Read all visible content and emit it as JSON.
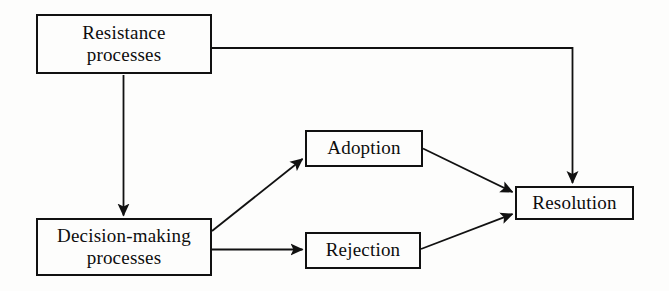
{
  "diagram": {
    "background_color": "#fdfdfc",
    "line_color": "#111111",
    "text_color": "#0d0d0d",
    "width": 669,
    "height": 291,
    "nodes": [
      {
        "id": "resistance",
        "label": "Resistance\nprocesses",
        "x": 36,
        "y": 14,
        "w": 176,
        "h": 60
      },
      {
        "id": "decision",
        "label": "Decision-making\nprocesses",
        "x": 36,
        "y": 218,
        "w": 176,
        "h": 58
      },
      {
        "id": "adoption",
        "label": "Adoption",
        "x": 305,
        "y": 130,
        "w": 118,
        "h": 37
      },
      {
        "id": "rejection",
        "label": "Rejection",
        "x": 305,
        "y": 232,
        "w": 116,
        "h": 37
      },
      {
        "id": "resolution",
        "label": "Resolution",
        "x": 515,
        "y": 186,
        "w": 119,
        "h": 34
      }
    ],
    "edges": [
      {
        "id": "resistance-to-resolution",
        "from": "resistance",
        "to": "resolution",
        "style": "orthogonal",
        "arrowhead": true
      },
      {
        "id": "resistance-to-decision",
        "from": "resistance",
        "to": "decision",
        "style": "vertical",
        "arrowhead": true
      },
      {
        "id": "decision-to-adoption",
        "from": "decision",
        "to": "adoption",
        "style": "diagonal",
        "arrowhead": true
      },
      {
        "id": "decision-to-rejection",
        "from": "decision",
        "to": "rejection",
        "style": "horizontal",
        "arrowhead": true
      },
      {
        "id": "adoption-to-resolution",
        "from": "adoption",
        "to": "resolution",
        "style": "diagonal",
        "arrowhead": true
      },
      {
        "id": "rejection-to-resolution",
        "from": "rejection",
        "to": "resolution",
        "style": "diagonal",
        "arrowhead": true
      }
    ]
  }
}
